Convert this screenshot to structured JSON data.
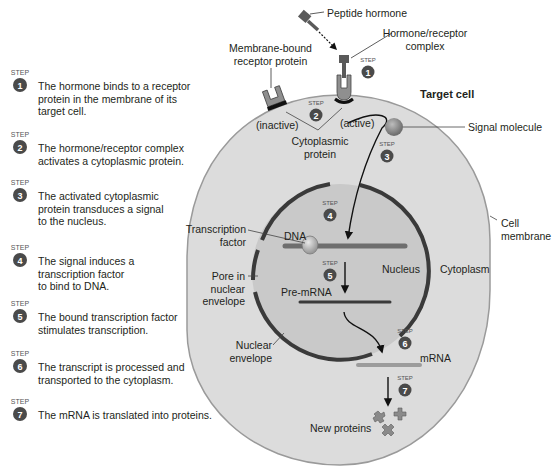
{
  "steps": [
    {
      "number": "1",
      "badge_label": "STEP",
      "text": "The hormone binds to a receptor\nprotein in the membrane of its\ntarget cell."
    },
    {
      "number": "2",
      "badge_label": "STEP",
      "text": "The hormone/receptor complex\nactivates a cytoplasmic protein."
    },
    {
      "number": "3",
      "badge_label": "STEP",
      "text": "The activated cytoplasmic\nprotein transduces a signal\nto the nucleus."
    },
    {
      "number": "4",
      "badge_label": "STEP",
      "text": "The signal induces a\ntranscription factor\nto bind to DNA."
    },
    {
      "number": "5",
      "badge_label": "STEP",
      "text": "The bound transcription factor\nstimulates transcription."
    },
    {
      "number": "6",
      "badge_label": "STEP",
      "text": "The transcript is processed and\ntransported to the cytoplasm."
    },
    {
      "number": "7",
      "badge_label": "STEP",
      "text": "The mRNA is translated into proteins."
    }
  ],
  "labels": {
    "peptide_hormone": "Peptide hormone",
    "hormone_receptor_complex": "Hormone/receptor\ncomplex",
    "membrane_bound_receptor": "Membrane-bound\nreceptor protein",
    "inactive": "(inactive)",
    "active": "(active)",
    "cytoplasmic_protein": "Cytoplasmic\nprotein",
    "target_cell": "Target cell",
    "signal_molecule": "Signal molecule",
    "cell_membrane": "Cell\nmembrane",
    "transcription_factor": "Transcription\nfactor",
    "dna": "DNA",
    "nucleus": "Nucleus",
    "cytoplasm": "Cytoplasm",
    "pore_in_nuclear_envelope": "Pore in\nnuclear\nenvelope",
    "pre_mrna": "Pre-mRNA",
    "nuclear_envelope": "Nuclear\nenvelope",
    "mrna": "mRNA",
    "new_proteins": "New proteins"
  },
  "colors": {
    "cell_fill": "#dcdcdc",
    "cell_outline": "#9a9a9a",
    "nucleus_fill": "#c9c9c9",
    "nuclear_envelope": "#3a3a3a",
    "badge": "#4a4a4a",
    "strand": "#6e6e6e",
    "mrna_strand": "#9c9c9c",
    "molecule": "#8a8a8a"
  }
}
